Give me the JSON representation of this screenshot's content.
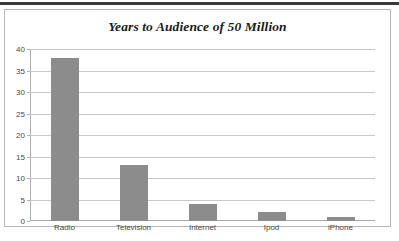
{
  "chart_data": {
    "type": "bar",
    "title": "Years to Audience of 50 Million",
    "categories": [
      "Radio",
      "Television",
      "Internet",
      "Ipod",
      "iPhone"
    ],
    "values": [
      38,
      13,
      4,
      2,
      1
    ],
    "xlabel": "",
    "ylabel": "",
    "ylim": [
      0,
      40
    ],
    "ytick_step": 5,
    "yticks": [
      "0",
      "5",
      "10",
      "15",
      "20",
      "25",
      "30",
      "35",
      "40"
    ],
    "grid": true,
    "legend": false,
    "bar_color": "#8c8c8c",
    "gridline_color": "#c8c8c8",
    "frame_color": "#b9b9b9",
    "title_color": "#1b1b1b",
    "tick_label_color": "#4a4a4a"
  },
  "page": {
    "caption_fragment": ""
  }
}
